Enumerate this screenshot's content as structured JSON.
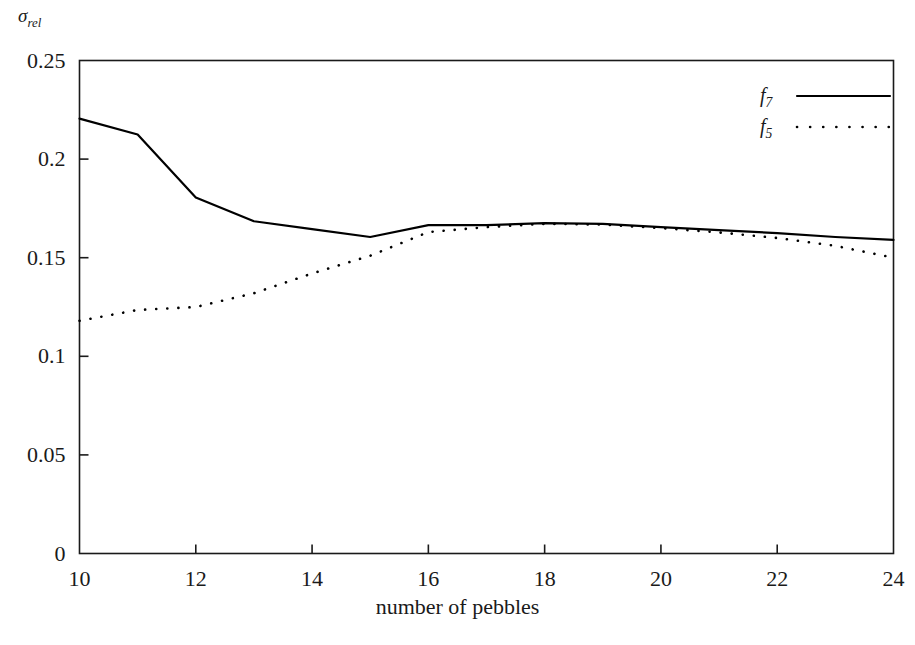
{
  "chart_data": {
    "type": "line",
    "title": "",
    "xlabel": "number of pebbles",
    "ylabel": "σ_rel",
    "ylabel_base": "σ",
    "ylabel_sub": "rel",
    "xlim": [
      10,
      24
    ],
    "ylim": [
      0,
      0.25
    ],
    "grid": false,
    "legend_position": "top-right",
    "x": [
      10,
      11,
      12,
      13,
      14,
      15,
      16,
      17,
      18,
      19,
      20,
      21,
      22,
      23,
      24
    ],
    "series": [
      {
        "name": "f7",
        "name_base": "f",
        "name_sub": "7",
        "style": "solid",
        "color": "#000000",
        "values": [
          0.2205,
          0.2125,
          0.1805,
          0.1685,
          0.1645,
          0.1605,
          0.1665,
          0.1665,
          0.1675,
          0.1672,
          0.1655,
          0.164,
          0.1625,
          0.1605,
          0.159
        ]
      },
      {
        "name": "f5",
        "name_base": "f",
        "name_sub": "5",
        "style": "dotted",
        "color": "#000000",
        "values": [
          0.118,
          0.1235,
          0.125,
          0.132,
          0.142,
          0.151,
          0.163,
          0.1655,
          0.1672,
          0.1668,
          0.165,
          0.1628,
          0.16,
          0.156,
          0.15
        ]
      }
    ],
    "xticks": [
      10,
      12,
      14,
      16,
      18,
      20,
      22,
      24
    ],
    "xtick_labels": [
      "10",
      "12",
      "14",
      "16",
      "18",
      "20",
      "22",
      "24"
    ],
    "yticks": [
      0,
      0.05,
      0.1,
      0.15,
      0.2,
      0.25
    ],
    "ytick_labels": [
      "0",
      "0.05",
      "0.1",
      "0.15",
      "0.2",
      "0.25"
    ],
    "legend": [
      {
        "label_base": "f",
        "label_sub": "7",
        "style": "solid"
      },
      {
        "label_base": "f",
        "label_sub": "5",
        "style": "dotted"
      }
    ],
    "axis_color": "#1a1a1a",
    "background": "#ffffff"
  }
}
